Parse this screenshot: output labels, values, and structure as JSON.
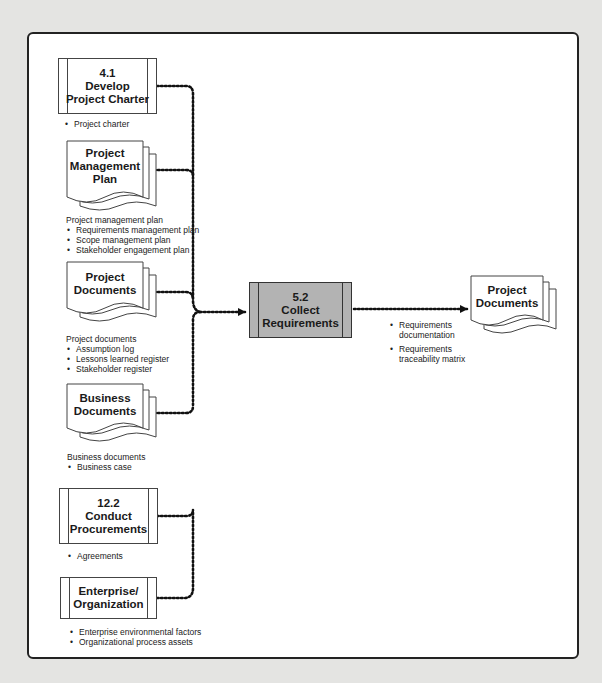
{
  "diagram": {
    "inputs": [
      {
        "id": "dev-charter",
        "shape": "process",
        "number": "4.1",
        "title_l1": "Develop",
        "title_l2": "Project Charter",
        "note_heading": "",
        "items": [
          "Project charter"
        ]
      },
      {
        "id": "pm-plan",
        "shape": "document",
        "title_l1": "Project",
        "title_l2": "Management",
        "title_l3": "Plan",
        "note_heading": "Project management plan",
        "items": [
          "Requirements management plan",
          "Scope management plan",
          "Stakeholder engagement plan"
        ]
      },
      {
        "id": "proj-docs",
        "shape": "document",
        "title_l1": "Project",
        "title_l2": "Documents",
        "note_heading": "Project documents",
        "items": [
          "Assumption log",
          "Lessons learned register",
          "Stakeholder register"
        ]
      },
      {
        "id": "biz-docs",
        "shape": "document",
        "title_l1": "Business",
        "title_l2": "Documents",
        "note_heading": "Business documents",
        "items": [
          "Business case"
        ]
      },
      {
        "id": "procurements",
        "shape": "process",
        "number": "12.2",
        "title_l1": "Conduct",
        "title_l2": "Procurements",
        "note_heading": "",
        "items": [
          "Agreements"
        ]
      },
      {
        "id": "enterprise",
        "shape": "process",
        "title_l1": "Enterprise/",
        "title_l2": "Organization",
        "note_heading": "",
        "items": [
          "Enterprise environmental factors",
          "Organizational process assets"
        ]
      }
    ],
    "center": {
      "number": "5.2",
      "title_l1": "Collect",
      "title_l2": "Requirements",
      "fill": "#b3b3b3"
    },
    "output": {
      "shape": "document",
      "title_l1": "Project",
      "title_l2": "Documents",
      "items": [
        "Requirements documentation",
        "Requirements traceability matrix"
      ],
      "items_lines": [
        [
          "Requirements",
          "documentation"
        ],
        [
          "Requirements",
          "traceability matrix"
        ]
      ]
    },
    "colors": {
      "background": "#e4e4e2",
      "frame_fill": "#ffffff",
      "frame_border": "#222222",
      "connector": "#111111"
    }
  }
}
